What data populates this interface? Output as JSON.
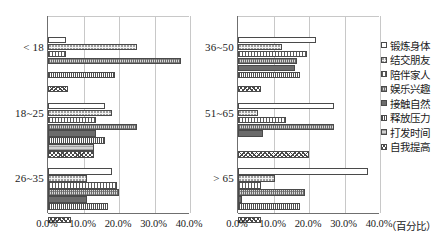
{
  "chart_data": {
    "type": "bar",
    "orientation": "horizontal",
    "title": "",
    "xlabel": "（百分比）",
    "ylabel": "",
    "xlim": [
      0,
      40
    ],
    "grid": true,
    "legend_position": "right",
    "xtick_labels": [
      "0.0%",
      "10.0%",
      "20.0%",
      "30.0%",
      "40.0%"
    ],
    "xtick_values": [
      0,
      10,
      20,
      30,
      40
    ],
    "unit_label": "（百分比）",
    "series": [
      {
        "name": "锻炼身体",
        "pattern": "open-white"
      },
      {
        "name": "结交朋友",
        "pattern": "fine-dots-light"
      },
      {
        "name": "陪伴家人",
        "pattern": "vertical-lines"
      },
      {
        "name": "娱乐兴趣",
        "pattern": "crosshatch-grey"
      },
      {
        "name": "接触自然",
        "pattern": "dense-dots-dark"
      },
      {
        "name": "释放压力",
        "pattern": "thin-vertical-lines"
      },
      {
        "name": "打发时间",
        "pattern": "horizontal-lines-grey"
      },
      {
        "name": "自我提高",
        "pattern": "diagonal-crosshatch"
      }
    ],
    "panels": [
      {
        "name": "left",
        "categories": [
          "< 18",
          "18~25",
          "26~35"
        ],
        "values": [
          [
            5.0,
            25.0,
            5.0,
            37.5,
            0.0,
            19.0,
            0.0,
            5.5
          ],
          [
            16.0,
            18.0,
            13.5,
            25.0,
            13.5,
            16.0,
            13.0,
            13.0
          ],
          [
            18.0,
            11.0,
            19.5,
            20.0,
            11.0,
            17.0,
            0.0,
            6.5
          ]
        ]
      },
      {
        "name": "right",
        "categories": [
          "36~50",
          "51~65",
          "> 65"
        ],
        "values": [
          [
            22.0,
            12.5,
            19.5,
            16.5,
            16.0,
            17.5,
            0.0,
            6.5
          ],
          [
            27.0,
            5.5,
            13.5,
            27.0,
            7.0,
            0.0,
            0.0,
            20.0
          ],
          [
            36.5,
            10.5,
            6.5,
            19.0,
            1.0,
            17.5,
            0.0,
            6.5
          ]
        ]
      }
    ]
  },
  "legend": {
    "items": [
      {
        "label": "锻炼身体"
      },
      {
        "label": "结交朋友"
      },
      {
        "label": "陪伴家人"
      },
      {
        "label": "娱乐兴趣"
      },
      {
        "label": "接触自然"
      },
      {
        "label": "释放压力"
      },
      {
        "label": "打发时间"
      },
      {
        "label": "自我提高"
      }
    ]
  }
}
